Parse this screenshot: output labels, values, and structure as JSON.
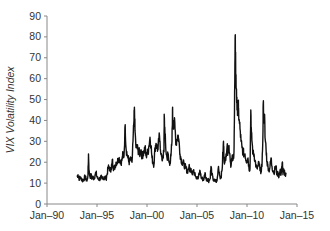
{
  "chart_data": {
    "type": "line",
    "title": "",
    "xlabel": "",
    "ylabel": "VIX Volatility Index",
    "ylim": [
      0,
      90
    ],
    "xlim": [
      1990,
      2015
    ],
    "yticks": [
      0,
      10,
      20,
      30,
      40,
      50,
      60,
      70,
      80,
      90
    ],
    "xticks": [
      {
        "label": "Jan–90",
        "year": 1990
      },
      {
        "label": "Jan–95",
        "year": 1995
      },
      {
        "label": "Jan–00",
        "year": 2000
      },
      {
        "label": "Jan–05",
        "year": 2005
      },
      {
        "label": "Jan–10",
        "year": 2010
      },
      {
        "label": "Jan–15",
        "year": 2015
      }
    ],
    "grid": false,
    "legend": null,
    "series": [
      {
        "name": "VIX Volatility Index",
        "color": "#111111",
        "points": [
          [
            1993.0,
            13
          ],
          [
            1993.1,
            14
          ],
          [
            1993.2,
            12
          ],
          [
            1993.3,
            13
          ],
          [
            1993.4,
            12
          ],
          [
            1993.5,
            12
          ],
          [
            1993.6,
            11
          ],
          [
            1993.7,
            12
          ],
          [
            1993.8,
            13
          ],
          [
            1993.9,
            12
          ],
          [
            1994.0,
            11
          ],
          [
            1994.1,
            14
          ],
          [
            1994.15,
            24
          ],
          [
            1994.2,
            16
          ],
          [
            1994.3,
            13
          ],
          [
            1994.4,
            14
          ],
          [
            1994.5,
            12
          ],
          [
            1994.6,
            13
          ],
          [
            1994.7,
            12
          ],
          [
            1994.8,
            14
          ],
          [
            1994.9,
            15
          ],
          [
            1995.0,
            13
          ],
          [
            1995.1,
            12
          ],
          [
            1995.2,
            12
          ],
          [
            1995.3,
            12
          ],
          [
            1995.4,
            13
          ],
          [
            1995.5,
            12
          ],
          [
            1995.6,
            13
          ],
          [
            1995.7,
            12
          ],
          [
            1995.8,
            13
          ],
          [
            1995.9,
            12
          ],
          [
            1996.0,
            14
          ],
          [
            1996.1,
            17
          ],
          [
            1996.2,
            18
          ],
          [
            1996.3,
            16
          ],
          [
            1996.4,
            17
          ],
          [
            1996.5,
            19
          ],
          [
            1996.55,
            21
          ],
          [
            1996.6,
            18
          ],
          [
            1996.7,
            17
          ],
          [
            1996.8,
            18
          ],
          [
            1996.9,
            20
          ],
          [
            1997.0,
            20
          ],
          [
            1997.1,
            21
          ],
          [
            1997.2,
            22
          ],
          [
            1997.3,
            21
          ],
          [
            1997.4,
            20
          ],
          [
            1997.5,
            21
          ],
          [
            1997.6,
            24
          ],
          [
            1997.7,
            23
          ],
          [
            1997.82,
            38
          ],
          [
            1997.9,
            27
          ],
          [
            1998.0,
            24
          ],
          [
            1998.1,
            22
          ],
          [
            1998.2,
            20
          ],
          [
            1998.3,
            21
          ],
          [
            1998.4,
            21
          ],
          [
            1998.5,
            20
          ],
          [
            1998.6,
            30
          ],
          [
            1998.7,
            40
          ],
          [
            1998.75,
            45
          ],
          [
            1998.8,
            35
          ],
          [
            1998.9,
            27
          ],
          [
            1999.0,
            27
          ],
          [
            1999.1,
            26
          ],
          [
            1999.2,
            25
          ],
          [
            1999.3,
            24
          ],
          [
            1999.4,
            26
          ],
          [
            1999.5,
            23
          ],
          [
            1999.6,
            24
          ],
          [
            1999.7,
            25
          ],
          [
            1999.8,
            27
          ],
          [
            1999.9,
            23
          ],
          [
            2000.0,
            24
          ],
          [
            2000.1,
            25
          ],
          [
            2000.2,
            28
          ],
          [
            2000.3,
            32
          ],
          [
            2000.4,
            28
          ],
          [
            2000.5,
            22
          ],
          [
            2000.6,
            20
          ],
          [
            2000.7,
            19
          ],
          [
            2000.8,
            27
          ],
          [
            2000.9,
            29
          ],
          [
            2001.0,
            27
          ],
          [
            2001.1,
            26
          ],
          [
            2001.2,
            32
          ],
          [
            2001.3,
            30
          ],
          [
            2001.4,
            24
          ],
          [
            2001.5,
            21
          ],
          [
            2001.6,
            23
          ],
          [
            2001.7,
            25
          ],
          [
            2001.72,
            43
          ],
          [
            2001.8,
            33
          ],
          [
            2001.9,
            25
          ],
          [
            2002.0,
            22
          ],
          [
            2002.1,
            24
          ],
          [
            2002.2,
            20
          ],
          [
            2002.3,
            20
          ],
          [
            2002.4,
            23
          ],
          [
            2002.5,
            30
          ],
          [
            2002.55,
            45
          ],
          [
            2002.6,
            38
          ],
          [
            2002.7,
            40
          ],
          [
            2002.8,
            36
          ],
          [
            2002.9,
            29
          ],
          [
            2003.0,
            31
          ],
          [
            2003.1,
            33
          ],
          [
            2003.2,
            30
          ],
          [
            2003.3,
            24
          ],
          [
            2003.4,
            22
          ],
          [
            2003.5,
            20
          ],
          [
            2003.6,
            20
          ],
          [
            2003.7,
            19
          ],
          [
            2003.8,
            18
          ],
          [
            2003.9,
            17
          ],
          [
            2004.0,
            16
          ],
          [
            2004.1,
            16
          ],
          [
            2004.2,
            18
          ],
          [
            2004.3,
            16
          ],
          [
            2004.4,
            17
          ],
          [
            2004.5,
            15
          ],
          [
            2004.6,
            16
          ],
          [
            2004.7,
            15
          ],
          [
            2004.8,
            15
          ],
          [
            2004.9,
            13
          ],
          [
            2005.0,
            13
          ],
          [
            2005.1,
            12
          ],
          [
            2005.2,
            14
          ],
          [
            2005.3,
            16
          ],
          [
            2005.4,
            13
          ],
          [
            2005.5,
            12
          ],
          [
            2005.6,
            12
          ],
          [
            2005.7,
            12
          ],
          [
            2005.8,
            15
          ],
          [
            2005.9,
            12
          ],
          [
            2006.0,
            12
          ],
          [
            2006.1,
            12
          ],
          [
            2006.2,
            11
          ],
          [
            2006.3,
            12
          ],
          [
            2006.4,
            18
          ],
          [
            2006.5,
            14
          ],
          [
            2006.6,
            12
          ],
          [
            2006.7,
            11
          ],
          [
            2006.8,
            11
          ],
          [
            2006.9,
            11
          ],
          [
            2007.0,
            11
          ],
          [
            2007.15,
            18
          ],
          [
            2007.3,
            13
          ],
          [
            2007.4,
            13
          ],
          [
            2007.5,
            16
          ],
          [
            2007.6,
            25
          ],
          [
            2007.65,
            30
          ],
          [
            2007.7,
            22
          ],
          [
            2007.8,
            20
          ],
          [
            2007.9,
            24
          ],
          [
            2008.0,
            27
          ],
          [
            2008.1,
            25
          ],
          [
            2008.2,
            28
          ],
          [
            2008.3,
            23
          ],
          [
            2008.4,
            18
          ],
          [
            2008.5,
            22
          ],
          [
            2008.6,
            21
          ],
          [
            2008.7,
            25
          ],
          [
            2008.75,
            45
          ],
          [
            2008.8,
            70
          ],
          [
            2008.83,
            81
          ],
          [
            2008.88,
            60
          ],
          [
            2008.95,
            55
          ],
          [
            2009.0,
            45
          ],
          [
            2009.1,
            48
          ],
          [
            2009.15,
            45
          ],
          [
            2009.2,
            40
          ],
          [
            2009.3,
            36
          ],
          [
            2009.4,
            30
          ],
          [
            2009.5,
            27
          ],
          [
            2009.6,
            25
          ],
          [
            2009.7,
            24
          ],
          [
            2009.8,
            24
          ],
          [
            2009.9,
            21
          ],
          [
            2010.0,
            21
          ],
          [
            2010.1,
            22
          ],
          [
            2010.2,
            17
          ],
          [
            2010.3,
            17
          ],
          [
            2010.38,
            45
          ],
          [
            2010.45,
            33
          ],
          [
            2010.5,
            30
          ],
          [
            2010.6,
            24
          ],
          [
            2010.7,
            24
          ],
          [
            2010.8,
            21
          ],
          [
            2010.9,
            18
          ],
          [
            2011.0,
            17
          ],
          [
            2011.1,
            18
          ],
          [
            2011.2,
            20
          ],
          [
            2011.3,
            16
          ],
          [
            2011.4,
            16
          ],
          [
            2011.5,
            18
          ],
          [
            2011.6,
            35
          ],
          [
            2011.62,
            48
          ],
          [
            2011.7,
            40
          ],
          [
            2011.75,
            43
          ],
          [
            2011.8,
            32
          ],
          [
            2011.9,
            27
          ],
          [
            2012.0,
            20
          ],
          [
            2012.1,
            18
          ],
          [
            2012.2,
            16
          ],
          [
            2012.3,
            18
          ],
          [
            2012.4,
            22
          ],
          [
            2012.5,
            18
          ],
          [
            2012.6,
            16
          ],
          [
            2012.7,
            15
          ],
          [
            2012.8,
            17
          ],
          [
            2012.9,
            18
          ],
          [
            2013.0,
            14
          ],
          [
            2013.1,
            15
          ],
          [
            2013.2,
            13
          ],
          [
            2013.3,
            16
          ],
          [
            2013.4,
            14
          ],
          [
            2013.5,
            18
          ],
          [
            2013.55,
            20
          ],
          [
            2013.6,
            14
          ],
          [
            2013.7,
            16
          ],
          [
            2013.8,
            14
          ],
          [
            2013.9,
            15
          ]
        ]
      }
    ]
  }
}
